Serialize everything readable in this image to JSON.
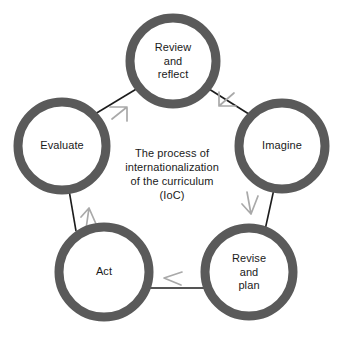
{
  "diagram": {
    "title": "The process of internationalization of the curriculum (IoC)",
    "type": "cycle",
    "center_text": "The process of\ninternationalization\nof the curriculum\n(IoC)",
    "ring_color": "#5a5a5a",
    "connector_color": "#1c1c1c",
    "arrow_color": "#a9a9a9",
    "background_color": "#ffffff",
    "nodes": [
      {
        "id": "review-and-reflect",
        "label": "Review\nand\nreflect",
        "cx": 173,
        "cy": 61,
        "r": 43
      },
      {
        "id": "imagine",
        "label": "Imagine",
        "cx": 282,
        "cy": 146,
        "r": 43
      },
      {
        "id": "revise-and-plan",
        "label": "Revise\nand\nplan",
        "cx": 249,
        "cy": 272,
        "r": 44
      },
      {
        "id": "act",
        "label": "Act",
        "cx": 104,
        "cy": 272,
        "r": 45
      },
      {
        "id": "evaluate",
        "label": "Evaluate",
        "cx": 62,
        "cy": 146,
        "r": 44
      }
    ],
    "connectors": [
      {
        "id": "evaluate-to-review",
        "from": "evaluate",
        "to": "review-and-reflect"
      },
      {
        "id": "review-to-imagine",
        "from": "review-and-reflect",
        "to": "imagine"
      },
      {
        "id": "imagine-to-revise",
        "from": "imagine",
        "to": "revise-and-plan"
      },
      {
        "id": "revise-to-act",
        "from": "revise-and-plan",
        "to": "act"
      },
      {
        "id": "act-to-evaluate",
        "from": "act",
        "to": "evaluate"
      }
    ]
  }
}
